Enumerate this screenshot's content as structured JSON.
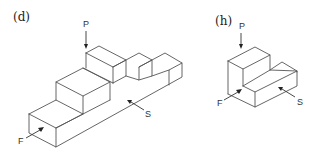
{
  "figures": [
    {
      "id": "d",
      "caption": "(d)",
      "description": "Isometric stepped block with two notches on top",
      "view_labels": {
        "top": "P",
        "front": "F",
        "side": "S"
      }
    },
    {
      "id": "h",
      "caption": "(h)",
      "description": "Isometric L-shaped block",
      "view_labels": {
        "top": "P",
        "front": "F",
        "side": "S"
      }
    }
  ],
  "colors": {
    "line": "#555555",
    "text": "#222222",
    "background": "#ffffff"
  }
}
